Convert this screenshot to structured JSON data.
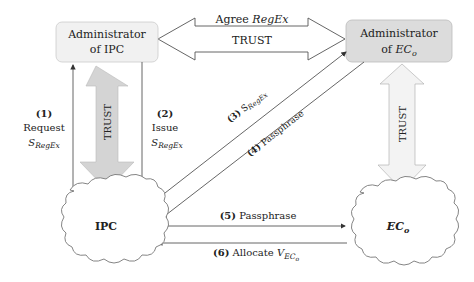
{
  "diagram": {
    "nodes": {
      "admin_ipc": {
        "line1": "Administrator",
        "line2": "of IPC"
      },
      "admin_ec": {
        "line1": "Administrator",
        "line2_prefix": "of ",
        "line2_main": "EC",
        "line2_sub": "o"
      },
      "ipc": {
        "label": "IPC"
      },
      "ec": {
        "main": "EC",
        "sub": "o"
      }
    },
    "trust_arrows": {
      "top_agree": {
        "line1_prefix": "Agree ",
        "line1_italic": "RegEx",
        "line2": "TRUST"
      },
      "left_vertical": {
        "label": "TRUST"
      },
      "right_vertical": {
        "label": "TRUST"
      }
    },
    "steps": {
      "s1": {
        "num": "(1)",
        "text": "Request",
        "sym": "S",
        "sub": "RegEx"
      },
      "s2": {
        "num": "(2)",
        "text": "Issue",
        "sym": "S",
        "sub": "RegEx"
      },
      "s3": {
        "num": "(3)",
        "sym": "S",
        "sub": "RegEx"
      },
      "s4": {
        "num": "(4)",
        "text": "Passphrase"
      },
      "s5": {
        "num": "(5)",
        "text": "Passphrase"
      },
      "s6": {
        "num": "(6)",
        "text": "Allocate ",
        "sym": "V",
        "sub": "EC",
        "subsub": "o"
      }
    },
    "colors": {
      "box_fill_ipc": "#f1f1f1",
      "box_fill_ec": "#dcdcdc",
      "trust_arrow_left": "#d4d4d4",
      "trust_arrow_right": "#f3f3f3",
      "line": "#555555"
    }
  }
}
